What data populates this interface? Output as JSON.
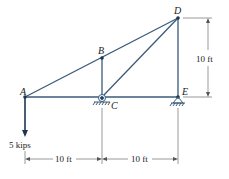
{
  "diagram": {
    "nodes": [
      {
        "id": "A",
        "label": "A"
      },
      {
        "id": "B",
        "label": "B"
      },
      {
        "id": "C",
        "label": "C"
      },
      {
        "id": "D",
        "label": "D"
      },
      {
        "id": "E",
        "label": "E"
      }
    ],
    "members": [
      "AB",
      "BD",
      "AC",
      "CE",
      "BC",
      "CD",
      "DE"
    ],
    "supports": [
      {
        "node": "C",
        "type": "roller"
      },
      {
        "node": "E",
        "type": "pin"
      }
    ],
    "load": {
      "node": "A",
      "label": "5 kips",
      "direction": "down"
    },
    "dimensions": {
      "height": "10 ft",
      "span_AC": "10 ft",
      "span_CE": "10 ft"
    },
    "colors": {
      "member": "#3a5a7a",
      "text": "#222222",
      "dim": "#555555"
    }
  }
}
